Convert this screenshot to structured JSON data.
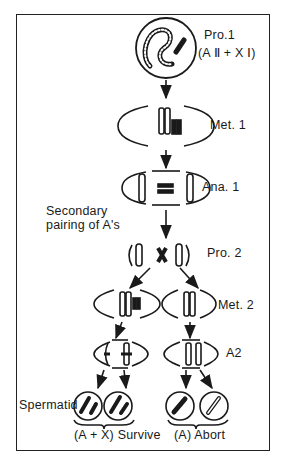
{
  "stages": {
    "pro1": {
      "label": "Pro.1",
      "sub": "(A Ⅱ + X Ⅰ)"
    },
    "met1": {
      "label": "Met. 1"
    },
    "ana1": {
      "label": "Ana. 1"
    },
    "secondary": {
      "line1": "Secondary",
      "line2": "pairing of A's"
    },
    "pro2": {
      "label": "Pro. 2"
    },
    "met2": {
      "label": "Met. 2"
    },
    "a2": {
      "label": "A2"
    },
    "spermatid": {
      "label": "Spermatid"
    }
  },
  "outcomes": {
    "survive": "(A + X) Survive",
    "abort": "(A) Abort"
  },
  "colors": {
    "ink": "#1a1a1a",
    "background": "#ffffff"
  }
}
